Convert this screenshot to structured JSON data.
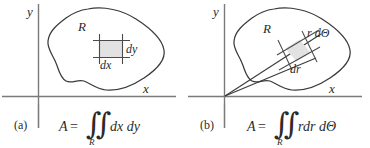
{
  "figure": {
    "type": "math-diagram",
    "background_color": "#ffffff",
    "line_color": "#3a3a3a",
    "axis_color": "#6b6b6b",
    "shade_color": "#e2e2e2"
  },
  "panels": [
    {
      "id": "a",
      "caption": "(a)",
      "axes": {
        "y_label": "y",
        "x_label": "x"
      },
      "region_label": "R",
      "element_labels": {
        "horizontal": "dx",
        "vertical": "dy"
      },
      "formula": {
        "lhs": "A",
        "equals": "=",
        "integral": "∬",
        "subscript": "R",
        "integrand": "dx dy",
        "plain": "A = ∬_R dx dy"
      }
    },
    {
      "id": "b",
      "caption": "(b)",
      "axes": {
        "y_label": "y",
        "x_label": "x"
      },
      "region_label": "R",
      "element_labels": {
        "arc": "r dΘ",
        "radial": "dr"
      },
      "formula": {
        "lhs": "A",
        "equals": "=",
        "integral": "∬",
        "subscript": "R",
        "integrand": "rdr dΘ",
        "plain": "A = ∬_R rdr dΘ"
      }
    }
  ]
}
